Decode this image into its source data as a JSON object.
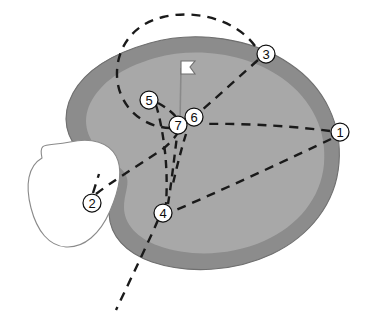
{
  "diagram": {
    "type": "golf-green-schematic",
    "width": 366,
    "height": 332,
    "background_color": "#ffffff"
  },
  "colors": {
    "green_surface": "#a8a8a8",
    "green_fringe": "#8c8c8c",
    "fringe_outline": "#6f6f6f",
    "hazard_fill": "#ffffff",
    "hazard_outline": "#8a8a8a",
    "path_stroke": "#1a1a1a",
    "marker_fill": "#ffffff",
    "marker_stroke": "#111111",
    "flag_fill": "#ffffff",
    "flag_outline": "#6f6f6f",
    "pole_color": "#8a8a8a"
  },
  "features": {
    "green_label": "putting green surface",
    "fringe_label": "green fringe collar",
    "hazard_label": "bunker hazard",
    "flag_label": "pin flag",
    "pole_label": "flagstick",
    "hole_label": "hole"
  },
  "markers": [
    {
      "id": "1",
      "label": "1",
      "cx": 340,
      "cy": 132,
      "r": 9,
      "location": "outside green, right edge"
    },
    {
      "id": "2",
      "label": "2",
      "cx": 92,
      "cy": 203,
      "r": 9,
      "location": "left side at bunker hazard"
    },
    {
      "id": "3",
      "label": "3",
      "cx": 266,
      "cy": 54,
      "r": 9,
      "location": "outside green, upper right"
    },
    {
      "id": "4",
      "label": "4",
      "cx": 163,
      "cy": 213,
      "r": 9,
      "location": "lower centre of green"
    },
    {
      "id": "5",
      "label": "5",
      "cx": 149,
      "cy": 100,
      "r": 9,
      "location": "upper centre of green"
    },
    {
      "id": "6",
      "label": "6",
      "cx": 194,
      "cy": 117,
      "r": 9,
      "location": "right of the hole"
    },
    {
      "id": "7",
      "label": "7",
      "cx": 178,
      "cy": 125,
      "r": 9,
      "location": "at the hole"
    }
  ],
  "putt_paths": [
    {
      "name": "path-from-1",
      "from": "1",
      "to": "7",
      "style": "dashed"
    },
    {
      "name": "path-from-1-lower",
      "from": "1",
      "to": "4",
      "style": "dashed"
    },
    {
      "name": "path-from-2",
      "from": "2",
      "to": "7",
      "style": "dashed"
    },
    {
      "name": "path-from-3-arc",
      "from": "3",
      "to": "7",
      "style": "dashed-arc"
    },
    {
      "name": "path-from-3-direct",
      "from": "3",
      "to": "6",
      "style": "dashed"
    },
    {
      "name": "path-from-4",
      "from": "4",
      "to": "7",
      "style": "dashed"
    },
    {
      "name": "path-from-4-extension",
      "from": "4",
      "to": "off-green-lower-left",
      "style": "dashed"
    },
    {
      "name": "path-from-5",
      "from": "5",
      "to": "7",
      "style": "dashed"
    }
  ]
}
